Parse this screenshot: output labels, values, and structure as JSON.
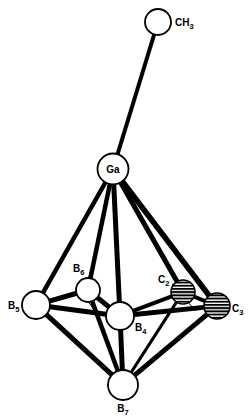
{
  "figure": {
    "kind": "molecular-structure-diagram",
    "title": "",
    "background_color": "#ffffff",
    "bond_color": "#000000",
    "atom_outline_color": "#000000",
    "atom_fill_open": "#ffffff",
    "atom_fill_hatched": "#ffffff",
    "hatch_color": "#000000",
    "width": 250,
    "height": 420
  },
  "chart_data": {
    "type": "diagram",
    "xlabel": "",
    "ylabel": "",
    "atoms": [
      {
        "id": "CH3",
        "label": "CH",
        "subscript": "3",
        "element": "C",
        "x": 158,
        "y": 22,
        "r": 13,
        "style": "open",
        "label_x": 175,
        "label_y": 26,
        "label_anchor": "start"
      },
      {
        "id": "Ga",
        "label": "Ga",
        "subscript": "",
        "element": "Ga",
        "x": 113,
        "y": 169,
        "r": 15.5,
        "style": "open",
        "label_x": 113,
        "label_y": 173,
        "label_anchor": "middle"
      },
      {
        "id": "B5",
        "label": "B",
        "subscript": "5",
        "element": "B",
        "x": 36,
        "y": 305,
        "r": 14,
        "style": "open",
        "label_x": 8,
        "label_y": 309,
        "label_anchor": "start"
      },
      {
        "id": "B6",
        "label": "B",
        "subscript": "6",
        "element": "B",
        "x": 88,
        "y": 290,
        "r": 12,
        "style": "open",
        "label_x": 73,
        "label_y": 272,
        "label_anchor": "start"
      },
      {
        "id": "B4",
        "label": "B",
        "subscript": "4",
        "element": "B",
        "x": 120,
        "y": 316,
        "r": 14,
        "style": "open",
        "label_x": 135,
        "label_y": 331,
        "label_anchor": "start"
      },
      {
        "id": "C2",
        "label": "C",
        "subscript": "2",
        "element": "C",
        "x": 183,
        "y": 292,
        "r": 12,
        "style": "hatched",
        "label_x": 158,
        "label_y": 283,
        "label_anchor": "start"
      },
      {
        "id": "C3",
        "label": "C",
        "subscript": "3",
        "element": "C",
        "x": 217,
        "y": 306,
        "r": 13,
        "style": "hatched",
        "label_x": 232,
        "label_y": 312,
        "label_anchor": "start"
      },
      {
        "id": "B7",
        "label": "B",
        "subscript": "7",
        "element": "B",
        "x": 123,
        "y": 385,
        "r": 15,
        "style": "open",
        "label_x": 123,
        "label_y": 412,
        "label_anchor": "middle"
      }
    ],
    "bonds": [
      {
        "from": "Ga",
        "to": "CH3",
        "width": 4.0
      },
      {
        "from": "Ga",
        "to": "B5",
        "width": 4.5
      },
      {
        "from": "Ga",
        "to": "B6",
        "width": 4.5
      },
      {
        "from": "Ga",
        "to": "B4",
        "width": 5.0
      },
      {
        "from": "Ga",
        "to": "C2",
        "width": 5.0
      },
      {
        "from": "Ga",
        "to": "C3",
        "width": 5.5
      },
      {
        "from": "B5",
        "to": "B6",
        "width": 5.0
      },
      {
        "from": "B6",
        "to": "B4",
        "width": 5.0
      },
      {
        "from": "B4",
        "to": "C2",
        "width": 4.0
      },
      {
        "from": "C2",
        "to": "C3",
        "width": 4.0
      },
      {
        "from": "B5",
        "to": "B4",
        "width": 5.0
      },
      {
        "from": "B4",
        "to": "C3",
        "width": 5.0
      },
      {
        "from": "B5",
        "to": "B7",
        "width": 5.0
      },
      {
        "from": "B6",
        "to": "B7",
        "width": 4.5
      },
      {
        "from": "B4",
        "to": "B7",
        "width": 5.0
      },
      {
        "from": "C2",
        "to": "B7",
        "width": 3.0
      },
      {
        "from": "C3",
        "to": "B7",
        "width": 5.0
      }
    ],
    "leaders": [
      {
        "id": "leader-b6",
        "x1": 91,
        "y1": 270,
        "x2": 87,
        "y2": 283,
        "width": 1.0
      },
      {
        "id": "leader-b6-lower",
        "x1": 84,
        "y1": 296,
        "x2": 95,
        "y2": 311,
        "width": 1.0
      },
      {
        "id": "leader-c2",
        "x1": 172,
        "y1": 284,
        "x2": 178,
        "y2": 288,
        "width": 1.0
      },
      {
        "id": "leader-c2-lower",
        "x1": 186,
        "y1": 300,
        "x2": 196,
        "y2": 311,
        "width": 1.0
      }
    ]
  }
}
